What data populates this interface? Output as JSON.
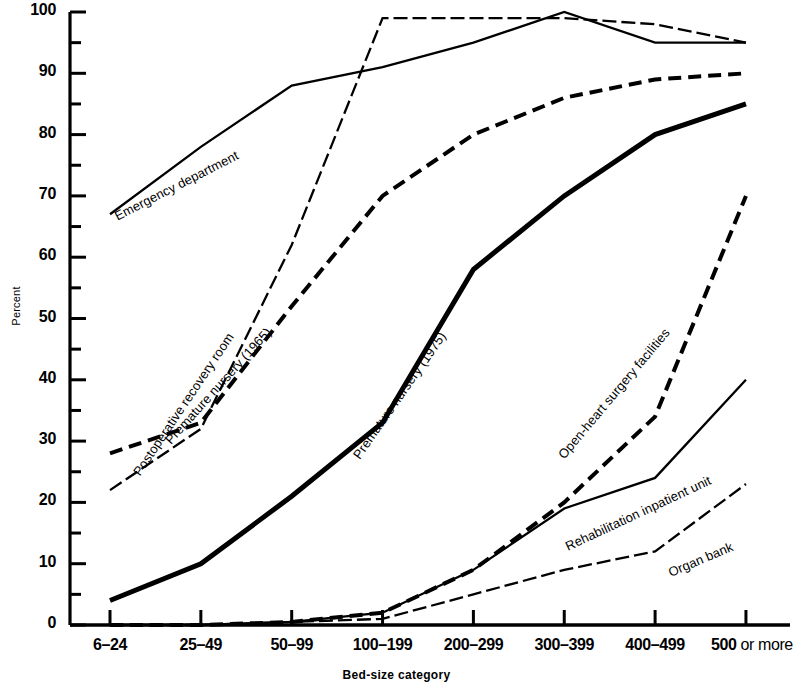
{
  "axes": {
    "ylabel": "Percent",
    "xlabel": "Bed-size category",
    "yticks": [
      "0",
      "10",
      "20",
      "30",
      "40",
      "50",
      "60",
      "70",
      "80",
      "90",
      "100"
    ],
    "xticks": [
      "6–24",
      "25–49",
      "50–99",
      "100–199",
      "200–299",
      "300–399",
      "400–499",
      "500 or more"
    ]
  },
  "chart_data": {
    "type": "line",
    "title": "",
    "xlabel": "Bed-size category",
    "ylabel": "Percent",
    "ylim": [
      0,
      100
    ],
    "grid": false,
    "legend": "inline-labels",
    "categories": [
      "6–24",
      "25–49",
      "50–99",
      "100–199",
      "200–299",
      "300–399",
      "400–499",
      "500 or more"
    ],
    "series": [
      {
        "name": "Emergency department",
        "style": "solid-thin",
        "color": "#000000",
        "values": [
          67,
          78,
          88,
          91,
          95,
          100,
          95,
          95
        ]
      },
      {
        "name": "Postoperative recovery room",
        "style": "dash-dot-thin",
        "color": "#000000",
        "values": [
          22,
          32,
          62,
          99,
          99,
          99,
          98,
          95
        ]
      },
      {
        "name": "Premature nursery (1965)",
        "style": "dashed-medium",
        "color": "#000000",
        "values": [
          28,
          33,
          52,
          70,
          80,
          86,
          89,
          90
        ]
      },
      {
        "name": "Premature nursery (1975)",
        "style": "solid-thick",
        "color": "#000000",
        "values": [
          4,
          10,
          21,
          33,
          58,
          70,
          80,
          85
        ]
      },
      {
        "name": "Open-heart surgery facilities",
        "style": "dashed-medium",
        "color": "#000000",
        "values": [
          0,
          0,
          0.5,
          2,
          9,
          20,
          34,
          70
        ]
      },
      {
        "name": "Rehabilitation inpatient unit",
        "style": "solid-thin",
        "color": "#000000",
        "values": [
          0,
          0,
          0.5,
          2,
          9,
          19,
          24,
          40
        ]
      },
      {
        "name": "Organ bank",
        "style": "dash-dot-thin",
        "color": "#000000",
        "values": [
          0,
          0,
          0.5,
          1,
          5,
          9,
          12,
          23
        ]
      }
    ],
    "annotations": [
      {
        "text": "Emergency department",
        "angle": -27
      },
      {
        "text": "Postoperative recovery room",
        "angle": -56
      },
      {
        "text": "Premature nursery (1965)",
        "angle": -48
      },
      {
        "text": "Premature nursery (1975)",
        "angle": -55
      },
      {
        "text": "Open-heart surgery facilities",
        "angle": -50
      },
      {
        "text": "Rehabilitation inpatient unit",
        "angle": -25
      },
      {
        "text": "Organ bank",
        "angle": -23
      }
    ]
  }
}
